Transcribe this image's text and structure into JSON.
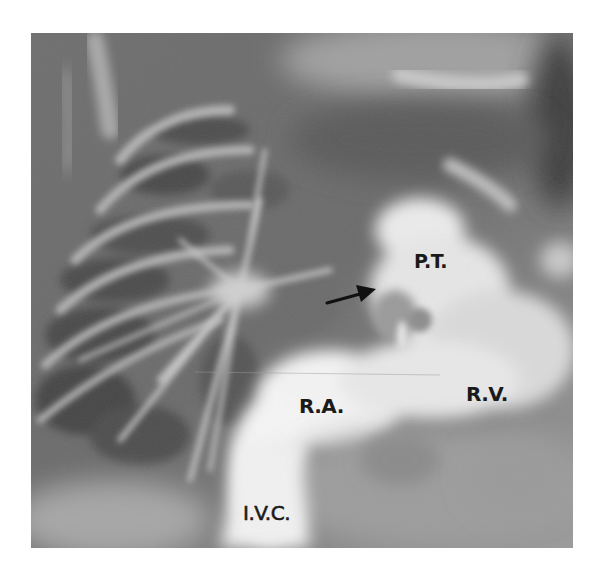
{
  "figure": {
    "type": "angiogram",
    "frame": {
      "x": 31,
      "y": 33,
      "width": 542,
      "height": 515
    },
    "background_color": "#ffffff"
  },
  "labels": {
    "pulmonary_trunk": "P.T.",
    "right_atrium": "R.A.",
    "right_ventricle": "R.V.",
    "inferior_vena_cava": "I.V.C."
  },
  "annotations": {
    "arrow": {
      "from": [
        327,
        303
      ],
      "to": [
        374,
        290
      ],
      "direction": "right",
      "color": "#111111"
    }
  },
  "colors": {
    "lung_dark": "#4a4a4a",
    "mid_gray": "#7d7d7d",
    "contrast_bright": "#f4f4f4",
    "label_text": "#1a1a1a"
  }
}
